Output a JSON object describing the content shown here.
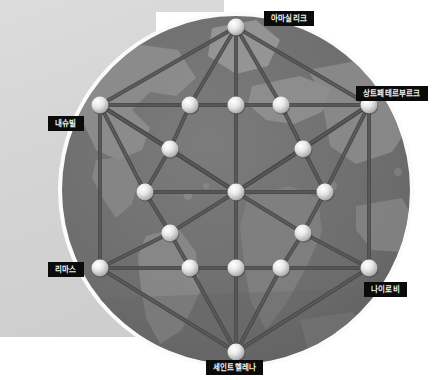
{
  "scene": {
    "type": "network-globe-diagram",
    "canvas_width": 445,
    "canvas_height": 380,
    "background_color": "#ffffff",
    "backdrop_panel_color": "#d7d7d7",
    "globe": {
      "name": "world-map-globe",
      "center_x": 236,
      "center_y": 190,
      "radius": 177,
      "rim_color": "#f5f5f5",
      "ocean_color": "#6f6f6f",
      "land_color": "#8d8d8d",
      "land_dark_color": "#5e5e5e"
    },
    "edge_color": "#4a4a4a",
    "node_color": "#e8e8e8",
    "node_radius": 8.5
  },
  "labels": [
    {
      "id": "amassalik",
      "text": "아마실리크",
      "x": 264,
      "y": 11,
      "anchor": "left"
    },
    {
      "id": "saint-petersburg",
      "text": "상트페테르부르크",
      "x": 356,
      "y": 86,
      "anchor": "left"
    },
    {
      "id": "nashville",
      "text": "내슈빌",
      "x": 48,
      "y": 116,
      "anchor": "left"
    },
    {
      "id": "limas",
      "text": "리마스",
      "x": 48,
      "y": 262,
      "anchor": "left"
    },
    {
      "id": "nairobi",
      "text": "나이로비",
      "x": 364,
      "y": 282,
      "anchor": "left"
    },
    {
      "id": "saint-helena",
      "text": "세인트헬레나",
      "x": 206,
      "y": 360,
      "anchor": "left"
    }
  ],
  "chart_data": {
    "type": "scatter",
    "title": "",
    "xlabel": "",
    "ylabel": "",
    "nodes": [
      {
        "id": "n-top",
        "x": 236,
        "y": 27,
        "label": "아마실리크"
      },
      {
        "id": "n-tl",
        "x": 100,
        "y": 105,
        "label": "내슈빌"
      },
      {
        "id": "n-t1",
        "x": 190,
        "y": 105,
        "label": ""
      },
      {
        "id": "n-t2",
        "x": 236,
        "y": 105,
        "label": ""
      },
      {
        "id": "n-t3",
        "x": 281,
        "y": 105,
        "label": ""
      },
      {
        "id": "n-tr",
        "x": 369,
        "y": 105,
        "label": "상트페테르부르크"
      },
      {
        "id": "n-ul",
        "x": 170,
        "y": 149,
        "label": ""
      },
      {
        "id": "n-ur",
        "x": 303,
        "y": 149,
        "label": ""
      },
      {
        "id": "n-ml",
        "x": 145,
        "y": 192,
        "label": ""
      },
      {
        "id": "n-mc",
        "x": 236,
        "y": 192,
        "label": ""
      },
      {
        "id": "n-mr",
        "x": 325,
        "y": 192,
        "label": ""
      },
      {
        "id": "n-ll",
        "x": 170,
        "y": 233,
        "label": ""
      },
      {
        "id": "n-lr",
        "x": 303,
        "y": 233,
        "label": ""
      },
      {
        "id": "n-bl",
        "x": 100,
        "y": 268,
        "label": "리마스"
      },
      {
        "id": "n-b1",
        "x": 190,
        "y": 268,
        "label": ""
      },
      {
        "id": "n-b2",
        "x": 236,
        "y": 268,
        "label": ""
      },
      {
        "id": "n-b3",
        "x": 281,
        "y": 268,
        "label": ""
      },
      {
        "id": "n-br",
        "x": 369,
        "y": 268,
        "label": "나이로비"
      },
      {
        "id": "n-bottom",
        "x": 236,
        "y": 352,
        "label": "세인트헬레나"
      }
    ],
    "edges": [
      [
        "n-top",
        "n-tl"
      ],
      [
        "n-top",
        "n-t1"
      ],
      [
        "n-top",
        "n-t2"
      ],
      [
        "n-top",
        "n-t3"
      ],
      [
        "n-top",
        "n-tr"
      ],
      [
        "n-tl",
        "n-t1"
      ],
      [
        "n-t1",
        "n-t2"
      ],
      [
        "n-t2",
        "n-t3"
      ],
      [
        "n-t3",
        "n-tr"
      ],
      [
        "n-tl",
        "n-ml"
      ],
      [
        "n-tl",
        "n-bl"
      ],
      [
        "n-tl",
        "n-ul"
      ],
      [
        "n-tl",
        "n-mc"
      ],
      [
        "n-tr",
        "n-mr"
      ],
      [
        "n-tr",
        "n-br"
      ],
      [
        "n-tr",
        "n-ur"
      ],
      [
        "n-tr",
        "n-mc"
      ],
      [
        "n-ul",
        "n-ml"
      ],
      [
        "n-ul",
        "n-mc"
      ],
      [
        "n-ul",
        "n-t1"
      ],
      [
        "n-ur",
        "n-mr"
      ],
      [
        "n-ur",
        "n-mc"
      ],
      [
        "n-ur",
        "n-t3"
      ],
      [
        "n-ml",
        "n-ll"
      ],
      [
        "n-ml",
        "n-mc"
      ],
      [
        "n-mr",
        "n-lr"
      ],
      [
        "n-mr",
        "n-mc"
      ],
      [
        "n-ll",
        "n-mc"
      ],
      [
        "n-ll",
        "n-bl"
      ],
      [
        "n-ll",
        "n-b1"
      ],
      [
        "n-lr",
        "n-mc"
      ],
      [
        "n-lr",
        "n-br"
      ],
      [
        "n-lr",
        "n-b3"
      ],
      [
        "n-bl",
        "n-b1"
      ],
      [
        "n-b1",
        "n-b2"
      ],
      [
        "n-b2",
        "n-b3"
      ],
      [
        "n-b3",
        "n-br"
      ],
      [
        "n-t2",
        "n-mc"
      ],
      [
        "n-mc",
        "n-b2"
      ],
      [
        "n-bottom",
        "n-bl"
      ],
      [
        "n-bottom",
        "n-b1"
      ],
      [
        "n-bottom",
        "n-b2"
      ],
      [
        "n-bottom",
        "n-b3"
      ],
      [
        "n-bottom",
        "n-br"
      ]
    ]
  }
}
